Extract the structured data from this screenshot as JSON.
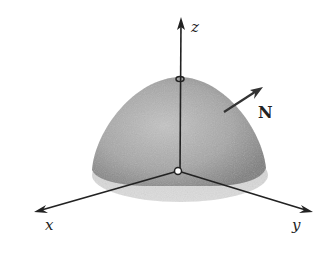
{
  "figure": {
    "axes": {
      "x_label": "x",
      "y_label": "y",
      "z_label": "z"
    },
    "vector_label": "N",
    "colors": {
      "surface": "#a8a8a8",
      "surface_dark": "#7a7a7a",
      "axis": "#222222",
      "background": "#ffffff"
    }
  }
}
